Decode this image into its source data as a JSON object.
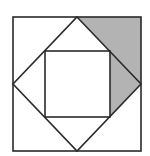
{
  "figure": {
    "title": "",
    "colors": {
      "background": "#ffffff",
      "stroke": "#2a2a2a",
      "shade": "#b3b3b3"
    },
    "stroke_width": 1.6,
    "outer_square": {
      "x": 13,
      "y": 17,
      "width": 128,
      "height": 134
    },
    "diamond": {
      "points": [
        [
          77,
          17
        ],
        [
          141,
          84
        ],
        [
          77,
          151
        ],
        [
          13,
          84
        ]
      ]
    },
    "inner_square": {
      "x": 45,
      "y": 51,
      "width": 65,
      "height": 66
    },
    "shaded_region": {
      "points": [
        [
          77,
          17
        ],
        [
          141,
          17
        ],
        [
          141,
          84
        ],
        [
          110,
          117
        ],
        [
          110,
          51
        ]
      ]
    }
  }
}
